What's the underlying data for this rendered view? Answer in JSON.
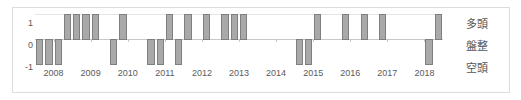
{
  "chart_data": {
    "type": "bar",
    "title": "",
    "subtitle": "",
    "xlabel": "",
    "ylabel": "",
    "ylim": [
      -1,
      1
    ],
    "yticks": [
      1,
      0,
      -1
    ],
    "ytick_labels": [
      "1",
      "0",
      "-1"
    ],
    "grid": true,
    "legend_position": "right",
    "bar_color": "#a9a9a9",
    "bar_edge_color": "#7f7f7f",
    "axis_color": "#c8c8c8",
    "frame_color": "#dcdcdc",
    "x_tick_labels": [
      "2008",
      "2009",
      "2010",
      "2011",
      "2012",
      "2013",
      "2014",
      "2015",
      "2016",
      "2017",
      "2018"
    ],
    "x": [
      "2008Q1",
      "2008Q2",
      "2008Q3",
      "2008Q4",
      "2009Q1",
      "2009Q2",
      "2009Q3",
      "2009Q4",
      "2010Q1",
      "2010Q2",
      "2010Q3",
      "2010Q4",
      "2011Q1",
      "2011Q2",
      "2011Q3",
      "2011Q4",
      "2012Q1",
      "2012Q2",
      "2012Q3",
      "2012Q4",
      "2013Q1",
      "2013Q2",
      "2013Q3",
      "2013Q4",
      "2014Q1",
      "2014Q2",
      "2014Q3",
      "2014Q4",
      "2015Q1",
      "2015Q2",
      "2015Q3",
      "2015Q4",
      "2016Q1",
      "2016Q2",
      "2016Q3",
      "2016Q4",
      "2017Q1",
      "2017Q2",
      "2017Q3",
      "2017Q4",
      "2018Q1",
      "2018Q2",
      "2018Q3",
      "2018Q4"
    ],
    "values": [
      -1,
      -1,
      -1,
      1,
      1,
      1,
      1,
      0,
      -1,
      1,
      0,
      0,
      -1,
      -1,
      1,
      -1,
      1,
      0,
      1,
      0,
      1,
      1,
      1,
      0,
      0,
      0,
      0,
      0,
      -1,
      -1,
      1,
      0,
      0,
      1,
      0,
      1,
      0,
      1,
      0,
      0,
      0,
      0,
      -1,
      1
    ],
    "value_legend": [
      {
        "value": "1",
        "label": "多頭"
      },
      {
        "value": "0",
        "label": "盤整"
      },
      {
        "value": "-1",
        "label": "空頭"
      }
    ]
  },
  "side_labels": {
    "bullish": "多頭",
    "consolidation": "盤整",
    "bearish": "空頭"
  },
  "y_axis": {
    "top": "1",
    "mid": "0",
    "bottom": "-1"
  }
}
